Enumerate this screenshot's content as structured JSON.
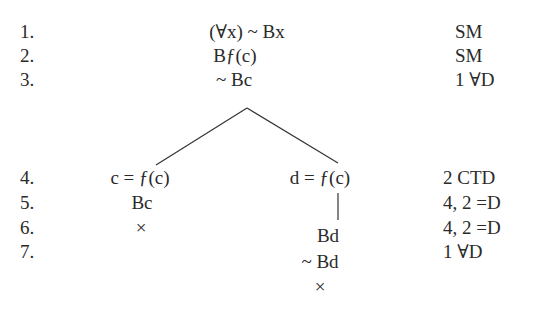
{
  "tree": {
    "rows": [
      {
        "num": "1.",
        "formula": "(∀x) ~ Bx",
        "justification": "SM"
      },
      {
        "num": "2.",
        "formula": "Bƒ(c)",
        "justification": "SM"
      },
      {
        "num": "3.",
        "formula": "~ Bc",
        "justification": "1 ∀D"
      },
      {
        "num": "4.",
        "left": "c = ƒ(c)",
        "right": "d = ƒ(c)",
        "justification": "2 CTD"
      },
      {
        "num": "5.",
        "left": "Bc",
        "right": "",
        "justification": "4, 2 =D"
      },
      {
        "num": "6.",
        "left": "×",
        "right": "Bd",
        "justification": "4, 2 =D"
      },
      {
        "num": "7.",
        "left": "",
        "right": "~ Bd",
        "justification": "1 ∀D"
      }
    ],
    "right_close": "×"
  }
}
